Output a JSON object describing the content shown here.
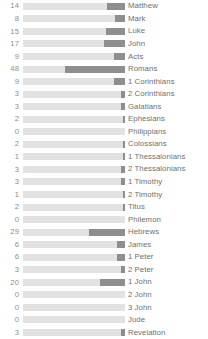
{
  "chart_data": {
    "type": "bar",
    "orientation": "horizontal",
    "title": "",
    "subtitle": "",
    "xlabel": "",
    "ylabel": "",
    "grid": false,
    "legend": null,
    "axis_ticks": [],
    "value_label_position": "left-of-bar",
    "track_max": 102,
    "px_per_unit": 1.255,
    "colors": {
      "track": "#e2e2e2",
      "fill": "#8e8e8e",
      "value_text": "#8d8d8d",
      "label_text": "#6f6f6f",
      "background": "#ffffff"
    },
    "categories": [
      "Matthew",
      "Mark",
      "Luke",
      "John",
      "Acts",
      "Romans",
      "1 Corinthians",
      "2 Corinthians",
      "Galatians",
      "Ephesians",
      "Philippians",
      "Colossians",
      "1 Thessalonians",
      "2 Thessalonians",
      "1 Timothy",
      "2 Timothy",
      "Titus",
      "Philemon",
      "Hebrews",
      "James",
      "1 Peter",
      "2 Peter",
      "1 John",
      "2 John",
      "3 John",
      "Jude",
      "Revelation"
    ],
    "values": [
      14,
      8,
      15,
      17,
      9,
      48,
      9,
      3,
      3,
      2,
      0,
      2,
      1,
      3,
      3,
      1,
      2,
      0,
      29,
      6,
      6,
      3,
      20,
      0,
      0,
      0,
      3
    ],
    "ylim": [
      0,
      48
    ]
  }
}
